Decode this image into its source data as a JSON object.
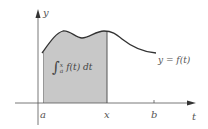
{
  "diagram": {
    "type": "area-under-curve",
    "colors": {
      "axis": "#444444",
      "curve": "#333333",
      "shade": "#c8c8c8",
      "label": "#555555"
    },
    "axes": {
      "x_label": "t",
      "y_label": "y"
    },
    "tick_labels": {
      "a": "a",
      "x": "x",
      "b": "b"
    },
    "curve_label": "y = f(t)",
    "integral_label": {
      "sign": "∫",
      "lower": "a",
      "upper": "x",
      "integrand": "f(t) dt"
    }
  }
}
